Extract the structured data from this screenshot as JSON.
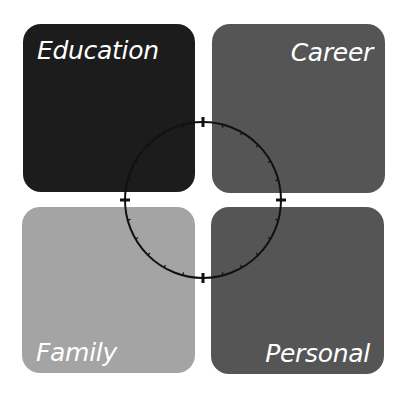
{
  "quadrants": [
    {
      "id": "education",
      "label": "Education",
      "color": "#1c1c1c",
      "position": "top-left"
    },
    {
      "id": "career",
      "label": "Career",
      "color": "#555555",
      "position": "top-right"
    },
    {
      "id": "family",
      "label": "Family",
      "color": "#a4a4a4",
      "position": "bottom-left"
    },
    {
      "id": "personal",
      "label": "Personal",
      "color": "#555555",
      "position": "bottom-right"
    }
  ],
  "ring": {
    "center": [
      203,
      200
    ],
    "radius": 78,
    "major_ticks": 4,
    "minor_ticks_per_quadrant": 5,
    "color": "#111111"
  }
}
